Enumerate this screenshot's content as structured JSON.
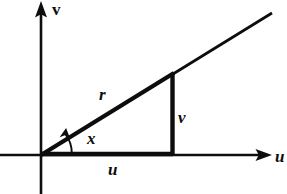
{
  "figure": {
    "stroke_color": "#0d0d0d",
    "background_color": "#ffffff",
    "axes": {
      "horizontal": {
        "name": "u-axis",
        "label": "u",
        "label_style": "italic",
        "arrow": "right",
        "y": 155,
        "x_start": 0,
        "x_end": 272
      },
      "vertical": {
        "name": "v-axis",
        "label": "v",
        "label_style": "upright",
        "arrow": "up",
        "x": 41,
        "y_start": 2,
        "y_end": 194
      }
    },
    "origin": {
      "x": 41,
      "y": 155
    },
    "triangle": {
      "vertices": [
        {
          "name": "origin",
          "x": 41,
          "y": 155
        },
        {
          "name": "foot",
          "x": 173,
          "y": 155
        },
        {
          "name": "apex",
          "x": 173,
          "y": 74
        }
      ],
      "sides": [
        {
          "name": "hypotenuse",
          "label": "r",
          "label_style": "italic"
        },
        {
          "name": "opposite",
          "label": "v",
          "label_style": "italic"
        },
        {
          "name": "adjacent",
          "label": "u",
          "label_style": "italic"
        }
      ]
    },
    "ray": {
      "name": "extended-hypotenuse-ray",
      "from": {
        "x": 41,
        "y": 155
      },
      "through": {
        "x": 173,
        "y": 74
      },
      "to": {
        "x": 272,
        "y": 13
      }
    },
    "angle": {
      "name": "angle-x",
      "label": "x",
      "label_style": "italic",
      "arc_radius": 30,
      "arrow": "counterclockwise",
      "at": {
        "x": 41,
        "y": 155
      }
    },
    "labels": {
      "v_axis": "v",
      "u_axis": "u",
      "hypotenuse": "r",
      "angle": "x",
      "vertical_side": "v",
      "horizontal_side": "u"
    }
  }
}
